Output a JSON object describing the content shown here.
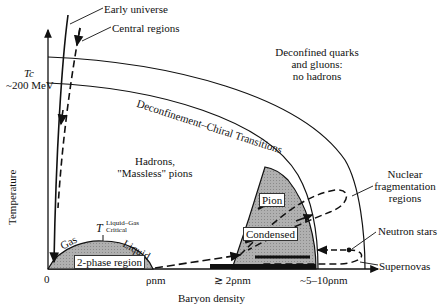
{
  "diagram": {
    "type": "qcd-phase-diagram",
    "axes": {
      "x_label": "Baryon density",
      "y_label": "Temperature",
      "x_ticks": [
        "0",
        "ρnm",
        "≳ 2ρnm",
        "~5–10ρnm"
      ],
      "y_tick": {
        "symbol": "Tc",
        "value": "~200 MeV"
      }
    },
    "regions": {
      "qgp": [
        "Deconfined quarks",
        "and gluons:",
        "no hadrons"
      ],
      "hadrons": [
        "Hadrons,",
        "\"Massless\" pions"
      ],
      "transition_band": "Deconfinement–Chiral Transitions",
      "two_phase": "2-phase region",
      "gas": "Gas",
      "liquid": "Liquid",
      "critical_T": "T",
      "critical_sup": "Liquid–Gas",
      "critical_sub": "Critical",
      "pion": "Pion",
      "condensed": "Condensed"
    },
    "trajectories": {
      "early_universe": "Early universe",
      "central_regions": "Central regions",
      "nuclear_fragmentation": [
        "Nuclear",
        "fragmentation",
        "regions"
      ],
      "neutron_stars": "Neutron stars",
      "supernovas": "Supernovas"
    },
    "colors": {
      "ink": "#111111",
      "fill": "#a8a8a8",
      "background": "#ffffff"
    }
  }
}
